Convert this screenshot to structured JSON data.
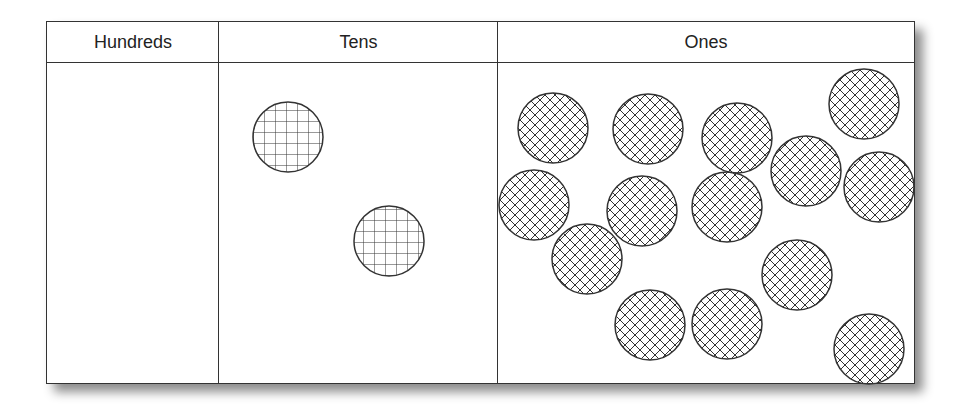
{
  "chart": {
    "columns": [
      {
        "label": "Hundreds",
        "count": 0,
        "pattern": "none"
      },
      {
        "label": "Tens",
        "count": 2,
        "pattern": "square-grid"
      },
      {
        "label": "Ones",
        "count": 14,
        "pattern": "diagonal-crosshatch"
      }
    ]
  },
  "colors": {
    "line": "#333333",
    "background": "#ffffff"
  },
  "tens_disks": [
    {
      "cx": 288,
      "cy": 137,
      "r": 35
    },
    {
      "cx": 389,
      "cy": 241,
      "r": 35
    }
  ],
  "ones_disks": [
    {
      "cx": 553,
      "cy": 128,
      "r": 35
    },
    {
      "cx": 648,
      "cy": 129,
      "r": 35
    },
    {
      "cx": 737,
      "cy": 138,
      "r": 35
    },
    {
      "cx": 864,
      "cy": 104,
      "r": 35
    },
    {
      "cx": 806,
      "cy": 171,
      "r": 35
    },
    {
      "cx": 879,
      "cy": 187,
      "r": 35
    },
    {
      "cx": 534,
      "cy": 205,
      "r": 35
    },
    {
      "cx": 642,
      "cy": 211,
      "r": 35
    },
    {
      "cx": 727,
      "cy": 207,
      "r": 35
    },
    {
      "cx": 587,
      "cy": 259,
      "r": 35
    },
    {
      "cx": 797,
      "cy": 275,
      "r": 35
    },
    {
      "cx": 650,
      "cy": 325,
      "r": 35
    },
    {
      "cx": 727,
      "cy": 324,
      "r": 35
    },
    {
      "cx": 869,
      "cy": 349,
      "r": 35
    }
  ]
}
